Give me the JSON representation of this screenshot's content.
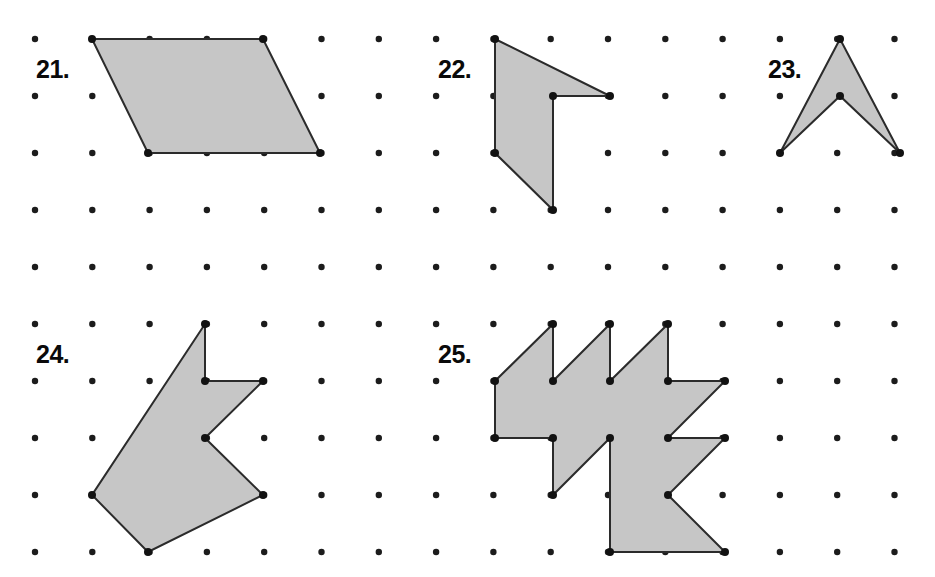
{
  "worksheet": {
    "title": "Geoboard Polygon Area Problems 21-25",
    "background_color": "#ffffff",
    "width": 935,
    "height": 577
  },
  "grid": {
    "name": "dot-grid",
    "origin_x": 35,
    "origin_y": 39,
    "spacing_x": 57.3,
    "spacing_y": 57,
    "columns": 16,
    "rows": 10,
    "dot_radius": 3.2,
    "dot_color": "#1c1c1c"
  },
  "style": {
    "shape_fill": "#c6c6c6",
    "shape_stroke": "#2b2b2b",
    "shape_stroke_width": 2,
    "vertex_dot_color": "#121212",
    "vertex_dot_radius": 4,
    "label_color": "#0a0a0a",
    "label_font_size": 25
  },
  "problems": [
    {
      "id": "problem-21",
      "label": "21.",
      "label_x": 36,
      "label_y": 78,
      "shape_name": "parallelogram",
      "points": "92,39 263,39 320,153 148,153",
      "vertices": [
        {
          "x": 92,
          "y": 39
        },
        {
          "x": 263,
          "y": 39
        },
        {
          "x": 320,
          "y": 153
        },
        {
          "x": 148,
          "y": 153
        }
      ]
    },
    {
      "id": "problem-22",
      "label": "22.",
      "label_x": 438,
      "label_y": 78,
      "shape_name": "notched-quadrilateral",
      "points": "495,39 610,96 553,96 553,210 495,153",
      "vertices": [
        {
          "x": 495,
          "y": 39
        },
        {
          "x": 610,
          "y": 96
        },
        {
          "x": 553,
          "y": 96
        },
        {
          "x": 553,
          "y": 210
        },
        {
          "x": 495,
          "y": 153
        }
      ]
    },
    {
      "id": "problem-23",
      "label": "23.",
      "label_x": 768,
      "label_y": 78,
      "shape_name": "chevron-arrowhead",
      "points": "840,39 900,153 840,96 780,153",
      "vertices": [
        {
          "x": 840,
          "y": 39
        },
        {
          "x": 900,
          "y": 153
        },
        {
          "x": 840,
          "y": 96
        },
        {
          "x": 780,
          "y": 153
        }
      ]
    },
    {
      "id": "problem-24",
      "label": "24.",
      "label_x": 36,
      "label_y": 363,
      "shape_name": "notched-arrow-polygon",
      "points": "205,324 205,381 263,381 205,438 263,495 148,552 92,495",
      "vertices": [
        {
          "x": 205,
          "y": 324
        },
        {
          "x": 205,
          "y": 381
        },
        {
          "x": 263,
          "y": 381
        },
        {
          "x": 205,
          "y": 438
        },
        {
          "x": 263,
          "y": 495
        },
        {
          "x": 148,
          "y": 552
        },
        {
          "x": 92,
          "y": 495
        }
      ]
    },
    {
      "id": "problem-25",
      "label": "25.",
      "label_x": 438,
      "label_y": 363,
      "shape_name": "sawtooth-star-polygon",
      "points": "495,381 553,324 553,381 610,324 610,381 668,324 668,381 725,381 668,438 725,438 668,495 725,552 610,552 610,438 553,495 553,438 495,438",
      "vertices": [
        {
          "x": 495,
          "y": 381
        },
        {
          "x": 553,
          "y": 324
        },
        {
          "x": 553,
          "y": 381
        },
        {
          "x": 610,
          "y": 324
        },
        {
          "x": 610,
          "y": 381
        },
        {
          "x": 668,
          "y": 324
        },
        {
          "x": 668,
          "y": 381
        },
        {
          "x": 725,
          "y": 381
        },
        {
          "x": 668,
          "y": 438
        },
        {
          "x": 725,
          "y": 438
        },
        {
          "x": 668,
          "y": 495
        },
        {
          "x": 725,
          "y": 552
        },
        {
          "x": 610,
          "y": 552
        },
        {
          "x": 610,
          "y": 438
        },
        {
          "x": 553,
          "y": 495
        },
        {
          "x": 553,
          "y": 438
        },
        {
          "x": 495,
          "y": 438
        }
      ]
    }
  ]
}
